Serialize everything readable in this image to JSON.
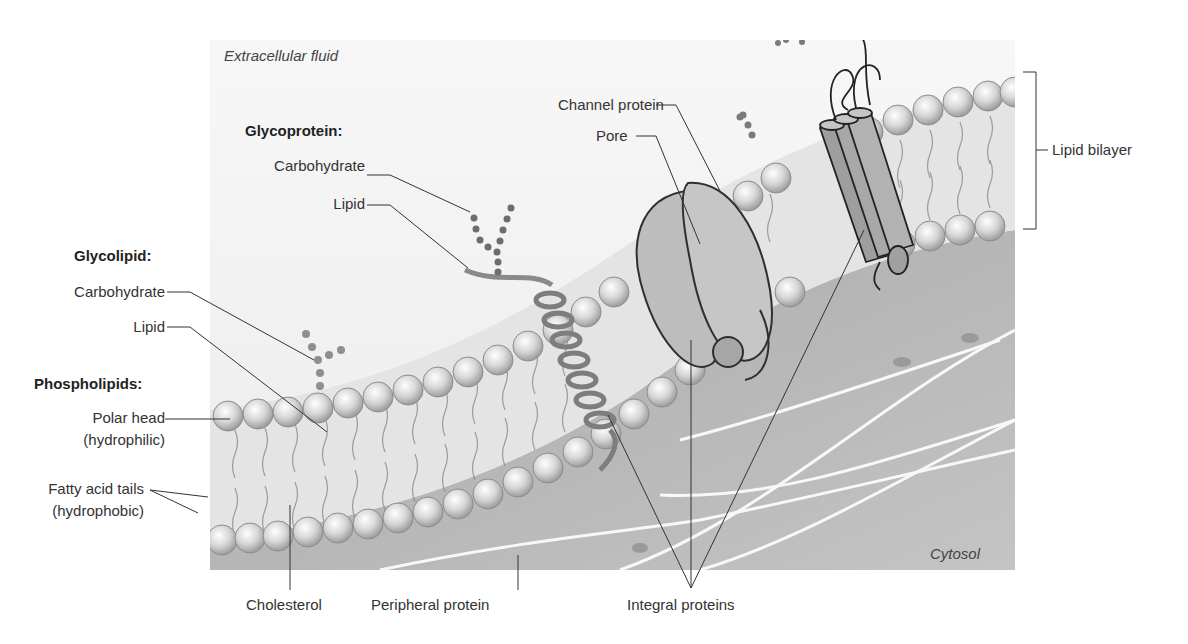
{
  "figure": {
    "regions": {
      "extracellular": "Extracellular fluid",
      "cytosol": "Cytosol"
    },
    "glycoprotein": {
      "heading": "Glycoprotein:",
      "carbohydrate": "Carbohydrate",
      "lipid": "Lipid"
    },
    "glycolipid": {
      "heading": "Glycolipid:",
      "carbohydrate": "Carbohydrate",
      "lipid": "Lipid"
    },
    "phospholipids": {
      "heading": "Phospholipids:",
      "polar_head_line1": "Polar head",
      "polar_head_line2": "(hydrophilic)",
      "tails_line1": "Fatty acid tails",
      "tails_line2": "(hydrophobic)"
    },
    "channel_protein": "Channel protein",
    "pore": "Pore",
    "lipid_bilayer": "Lipid bilayer",
    "cholesterol": "Cholesterol",
    "peripheral_protein": "Peripheral protein",
    "integral_proteins": "Integral proteins"
  },
  "colors": {
    "panel_light": "#f2f2f2",
    "cytosol": "#b9b9b9",
    "head": "#d9d9d9",
    "protein": "#9a9a9a",
    "line": "#333333"
  }
}
